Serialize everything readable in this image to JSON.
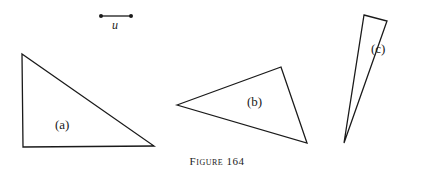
{
  "unit_segment": {
    "label": "u",
    "x1": 101,
    "y1": 16,
    "x2": 131,
    "y2": 16
  },
  "triangles": [
    {
      "label": "(a)",
      "points": "22,54 23,147 154,146",
      "label_x": 55,
      "label_y": 118
    },
    {
      "label": "(b)",
      "points": "177,105 281,67 307,143",
      "label_x": 247,
      "label_y": 95
    },
    {
      "label": "(c)",
      "points": "364,15 387,21 344,143",
      "label_x": 371,
      "label_y": 42
    }
  ],
  "caption": "Figure 164",
  "colors": {
    "stroke": "#1a1a1a",
    "background": "#ffffff"
  }
}
